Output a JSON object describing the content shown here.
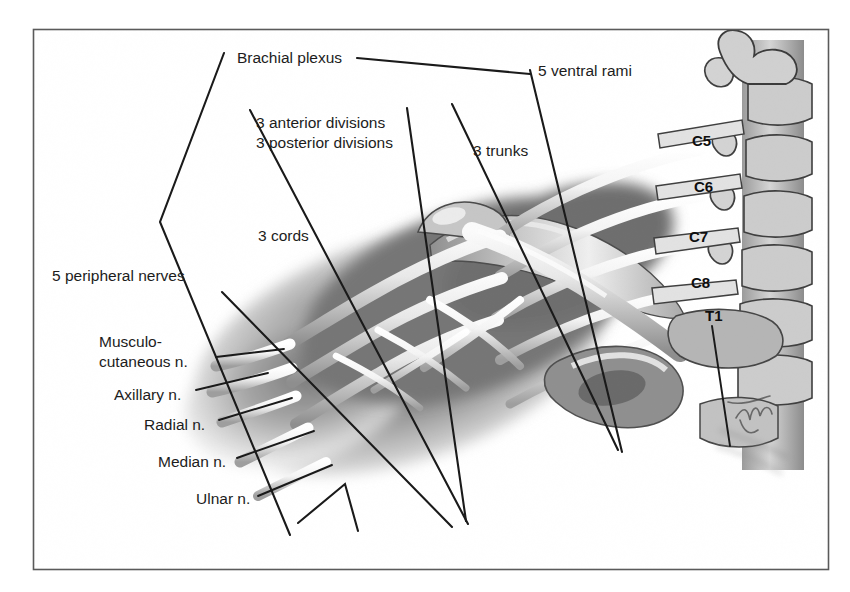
{
  "figure": {
    "frame": {
      "x": 33,
      "y": 29,
      "width": 796,
      "height": 541,
      "color": "#5a5a5a"
    },
    "background_color": "#ffffff",
    "ink_color": "#1a1a1a",
    "signature": "artist-signature"
  },
  "labels": [
    {
      "id": "brachial-plexus",
      "text": "Brachial plexus",
      "x": 237,
      "y": 59,
      "anchor": "start"
    },
    {
      "id": "five-ventral-rami",
      "text": "5 ventral rami",
      "x": 538,
      "y": 72,
      "anchor": "start"
    },
    {
      "id": "three-anterior-div",
      "text": "3 anterior divisions",
      "x": 256,
      "y": 124,
      "anchor": "start"
    },
    {
      "id": "three-posterior-div",
      "text": "3 posterior divisions",
      "x": 256,
      "y": 144,
      "anchor": "start"
    },
    {
      "id": "three-trunks",
      "text": "3 trunks",
      "x": 473,
      "y": 152,
      "anchor": "start"
    },
    {
      "id": "three-cords",
      "text": "3 cords",
      "x": 258,
      "y": 237,
      "anchor": "start"
    },
    {
      "id": "five-peripheral",
      "text": "5 peripheral nerves",
      "x": 52,
      "y": 277,
      "anchor": "start"
    },
    {
      "id": "musculocutaneous-1",
      "text": "Musculo-",
      "x": 99,
      "y": 343,
      "anchor": "start"
    },
    {
      "id": "musculocutaneous-2",
      "text": "cutaneous n.",
      "x": 99,
      "y": 363,
      "anchor": "start"
    },
    {
      "id": "axillary",
      "text": "Axillary n.",
      "x": 114,
      "y": 396,
      "anchor": "start"
    },
    {
      "id": "radial",
      "text": "Radial n.",
      "x": 144,
      "y": 426,
      "anchor": "start"
    },
    {
      "id": "median",
      "text": "Median n.",
      "x": 158,
      "y": 463,
      "anchor": "start"
    },
    {
      "id": "ulnar",
      "text": "Ulnar n.",
      "x": 196,
      "y": 500,
      "anchor": "start"
    }
  ],
  "vertebrae": [
    {
      "id": "c5",
      "text": "C5",
      "x": 692,
      "y": 142
    },
    {
      "id": "c6",
      "text": "C6",
      "x": 694,
      "y": 188
    },
    {
      "id": "c7",
      "text": "C7",
      "x": 689,
      "y": 238
    },
    {
      "id": "c8",
      "text": "C8",
      "x": 691,
      "y": 284
    },
    {
      "id": "t1",
      "text": "T1",
      "x": 705,
      "y": 317
    }
  ],
  "leader_lines": [
    {
      "id": "brachial-plexus-bracket",
      "points": "224,53 160,222 290,535"
    },
    {
      "id": "brachial-plexus-dash",
      "points": "355,58 528,75"
    },
    {
      "id": "ventral-rami-leader",
      "points": "530,70 621,452"
    },
    {
      "id": "anterior-divisions-leader",
      "points": "407,108 467,525"
    },
    {
      "id": "posterior-divisions-leader",
      "points": "250,110 243,113 465,522"
    },
    {
      "id": "trunks-leader",
      "points": "529,75 620,450"
    },
    {
      "id": "cords-leader",
      "points": "222,292 452,527"
    },
    {
      "id": "peripheral-bracket",
      "points": "298,523 348,484 357,531"
    },
    {
      "id": "musculocutaneous-leader",
      "points": "215,356 281,348"
    },
    {
      "id": "axillary-leader",
      "points": "196,387 266,372"
    },
    {
      "id": "radial-leader",
      "points": "218,417 291,397"
    },
    {
      "id": "median-leader",
      "points": "236,456 313,430"
    },
    {
      "id": "ulnar-leader",
      "points": "256,494 330,464"
    },
    {
      "id": "t1-leader",
      "points": "710,325 728,446"
    }
  ],
  "colors": {
    "ink": "#1a1a1a",
    "frame": "#5a5a5a",
    "shade_dark": "#6b6b6b",
    "shade_mid": "#9a9a9a",
    "shade_light": "#d8d8d8",
    "nerve_highlight": "#f2f2f2",
    "bone_fill": "#b9b9b9"
  }
}
